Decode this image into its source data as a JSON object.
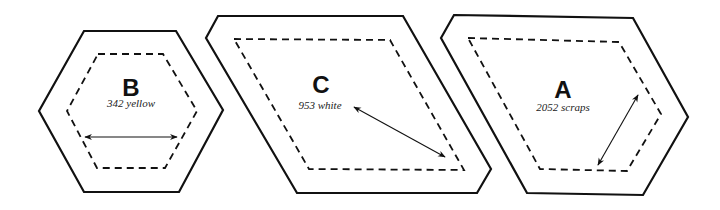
{
  "diagram": {
    "pieces": [
      {
        "id": "B",
        "letter": "B",
        "caption": "342 yellow",
        "shape": "hexagon"
      },
      {
        "id": "C",
        "letter": "C",
        "caption": "953 white",
        "shape": "diamond"
      },
      {
        "id": "A",
        "letter": "A",
        "caption": "2052 scraps",
        "shape": "half-hexagon"
      }
    ],
    "legend": {
      "solid_line": "cutting line",
      "dashed_line": "seam line",
      "arrow": "grain line"
    },
    "colors": {
      "stroke": "#111111",
      "background": "#ffffff"
    }
  }
}
